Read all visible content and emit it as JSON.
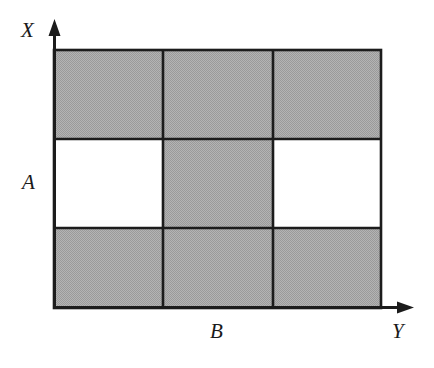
{
  "figure": {
    "title": "",
    "kind": "grid-diagram",
    "background_color": "#ffffff",
    "line_color": "#1c1c1c",
    "shaded_color": "#aaaaaa",
    "blank_color": "#ffffff",
    "labels": {
      "x_axis": "X",
      "y_axis": "Y",
      "row_marker": "A",
      "column_marker": "B"
    },
    "axes": {
      "vertical": {
        "name": "X",
        "origin_x": 54,
        "base_y": 308,
        "tip_y": 22,
        "arrow": "up-arrow"
      },
      "horizontal": {
        "name": "Y",
        "origin_y": 308,
        "base_x": 54,
        "tip_x": 414,
        "arrow": "right-arrow"
      }
    },
    "grid": {
      "left": 54,
      "top": 50,
      "right": 381,
      "bottom": 308,
      "columns": 3,
      "rows": 3,
      "column_edges": [
        54,
        163,
        273,
        381
      ],
      "row_edges": [
        50,
        139,
        228,
        308
      ],
      "cells": [
        [
          {
            "id": "r1c1",
            "fill": "shaded"
          },
          {
            "id": "r1c2",
            "fill": "shaded"
          },
          {
            "id": "r1c3",
            "fill": "shaded"
          }
        ],
        [
          {
            "id": "r2c1",
            "fill": "blank"
          },
          {
            "id": "r2c2",
            "fill": "shaded"
          },
          {
            "id": "r2c3",
            "fill": "blank"
          }
        ],
        [
          {
            "id": "r3c1",
            "fill": "shaded"
          },
          {
            "id": "r3c2",
            "fill": "shaded"
          },
          {
            "id": "r3c3",
            "fill": "shaded"
          }
        ]
      ]
    }
  }
}
